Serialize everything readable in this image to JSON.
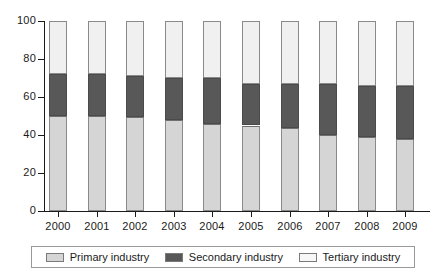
{
  "chart_data": {
    "type": "bar",
    "subtype": "stacked-100-percent",
    "title": "",
    "xlabel": "",
    "ylabel": "",
    "categories": [
      "2000",
      "2001",
      "2002",
      "2003",
      "2004",
      "2005",
      "2006",
      "2007",
      "2008",
      "2009"
    ],
    "ylim": [
      0,
      100
    ],
    "yticks": [
      0,
      20,
      40,
      60,
      80,
      100
    ],
    "ytick_labels": [
      "0",
      "20",
      "40",
      "60",
      "80",
      "100"
    ],
    "grid": false,
    "legend_position": "bottom",
    "series": [
      {
        "name": "Primary industry",
        "color": "#d5d5d5",
        "values": [
          50,
          50,
          49.5,
          48,
          46,
          45,
          43.5,
          40,
          39,
          38
        ]
      },
      {
        "name": "Secondary industry",
        "color": "#585858",
        "values": [
          22,
          22,
          21.5,
          22,
          24,
          22,
          23.5,
          27,
          27,
          28
        ]
      },
      {
        "name": "Tertiary industry",
        "color": "#f0f0f0",
        "values": [
          28,
          28,
          29,
          30,
          30,
          33,
          33,
          33,
          34,
          34
        ]
      }
    ],
    "cumulative_tops": {
      "primary": [
        50,
        50,
        49.5,
        48,
        46,
        45,
        43.5,
        40,
        39,
        38
      ],
      "secondary": [
        72,
        72,
        71,
        70,
        70,
        67,
        67,
        67,
        66,
        66
      ],
      "tertiary": [
        100,
        100,
        100,
        100,
        100,
        100,
        100,
        100,
        100,
        100
      ]
    }
  },
  "legend": {
    "items": [
      {
        "label": "Primary industry",
        "swatch": "#d5d5d5"
      },
      {
        "label": "Secondary industry",
        "swatch": "#585858"
      },
      {
        "label": "Tertiary industry",
        "swatch": "#f7f7f7"
      }
    ]
  }
}
